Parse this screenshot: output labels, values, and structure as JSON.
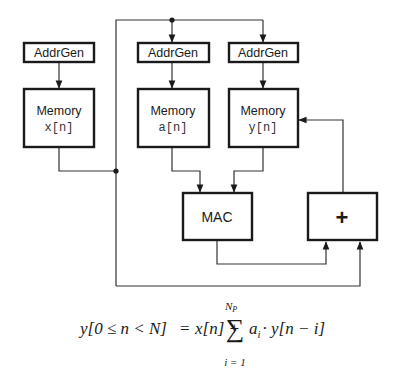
{
  "diagram": {
    "blocks": {
      "addrgen_x": {
        "label": "AddrGen"
      },
      "addrgen_a": {
        "label": "AddrGen"
      },
      "addrgen_y": {
        "label": "AddrGen"
      },
      "memory_x": {
        "label": "Memory",
        "signal": "x[n]"
      },
      "memory_a": {
        "label": "Memory",
        "signal": "a[n]"
      },
      "memory_y": {
        "label": "Memory",
        "signal": "y[n]"
      },
      "mac": {
        "label": "MAC"
      },
      "adder": {
        "label": "+"
      }
    },
    "connections": [
      {
        "from": "addrgen_x",
        "to": "memory_x"
      },
      {
        "from": "addrgen_a",
        "to": "memory_a"
      },
      {
        "from": "addrgen_y",
        "to": "memory_y"
      },
      {
        "from": "top_bus",
        "to": "addrgen_a"
      },
      {
        "from": "top_bus",
        "to": "addrgen_y"
      },
      {
        "from": "memory_x",
        "to": "junction_left"
      },
      {
        "from": "memory_a",
        "to": "mac"
      },
      {
        "from": "memory_y",
        "to": "mac"
      },
      {
        "from": "mac",
        "to": "adder"
      },
      {
        "from": "memory_x",
        "to": "adder"
      },
      {
        "from": "adder",
        "to": "memory_y"
      }
    ],
    "colors": {
      "stroke": "#1a1a1a",
      "wire": "#333333",
      "background": "#ffffff"
    }
  },
  "formula": {
    "lhs": "y[0 ≤ n < N]",
    "equals": "=",
    "term1": "x[n] +",
    "sum_symbol": "∑",
    "sum_upper": "N",
    "sum_upper_sub": "P",
    "sum_lower": "i = 1",
    "summand_a": "a",
    "summand_a_sub": "i",
    "summand_rest": "· y[n − i]"
  }
}
